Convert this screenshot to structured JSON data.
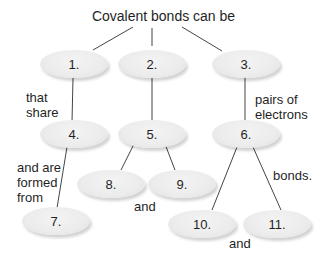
{
  "title": "Covalent bonds can be",
  "nodes": {
    "n1": "1.",
    "n2": "2.",
    "n3": "3.",
    "n4": "4.",
    "n5": "5.",
    "n6": "6.",
    "n7": "7.",
    "n8": "8.",
    "n9": "9.",
    "n10": "10.",
    "n11": "11."
  },
  "links": {
    "that_share": "that share",
    "pairs_of_electrons": "pairs of electrons",
    "and_are_formed_from": "and are formed from",
    "and_8_9": "and",
    "bonds": "bonds.",
    "and_10_11": "and"
  },
  "colors": {
    "node_fill": "#ececec",
    "line": "#333333",
    "text": "#1f1f1f"
  }
}
